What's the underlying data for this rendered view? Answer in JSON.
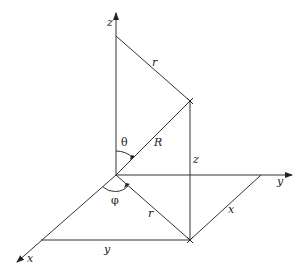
{
  "diagram": {
    "axes": {
      "z": "z",
      "y": "y",
      "x": "x"
    },
    "labels": {
      "r_top": "r",
      "theta": "θ",
      "R": "R",
      "z_vertical": "z",
      "phi": "φ",
      "r_bottom": "r",
      "x_segment": "x",
      "y_segment": "y"
    },
    "colors": {
      "line": "#333333",
      "background": "#ffffff"
    }
  }
}
